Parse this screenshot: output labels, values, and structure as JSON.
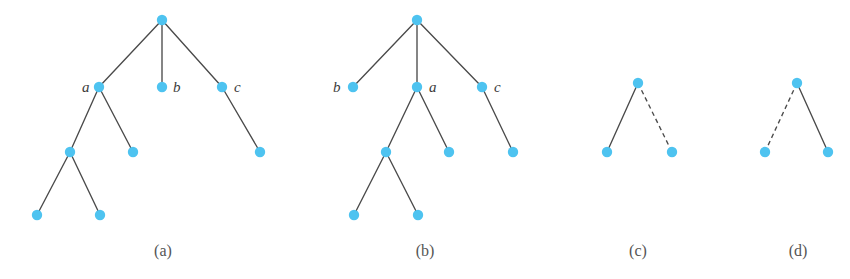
{
  "figure": {
    "background_color": "#ffffff",
    "node_color": "#4ec3f0",
    "edge_color": "#4a4a4a",
    "label_color": "#3b3b3b",
    "caption_color": "#555555",
    "node_radius": 5.2,
    "panels": [
      {
        "id": "panel-a",
        "caption": "(a)",
        "caption_x": 163,
        "caption_y": 256,
        "nodes": [
          {
            "id": "a-root",
            "x": 162,
            "y": 20,
            "label": "",
            "label_x": 0,
            "label_y": 0
          },
          {
            "id": "a-n1",
            "x": 99,
            "y": 87,
            "label": "a",
            "label_x": 82,
            "label_y": 92
          },
          {
            "id": "a-n2",
            "x": 162,
            "y": 87,
            "label": "b",
            "label_x": 173,
            "label_y": 92
          },
          {
            "id": "a-n3",
            "x": 222,
            "y": 87,
            "label": "c",
            "label_x": 234,
            "label_y": 92
          },
          {
            "id": "a-n4",
            "x": 70,
            "y": 152,
            "label": "",
            "label_x": 0,
            "label_y": 0
          },
          {
            "id": "a-n5",
            "x": 133,
            "y": 152,
            "label": "",
            "label_x": 0,
            "label_y": 0
          },
          {
            "id": "a-n6",
            "x": 260,
            "y": 152,
            "label": "",
            "label_x": 0,
            "label_y": 0
          },
          {
            "id": "a-n7",
            "x": 37,
            "y": 215,
            "label": "",
            "label_x": 0,
            "label_y": 0
          },
          {
            "id": "a-n8",
            "x": 100,
            "y": 215,
            "label": "",
            "label_x": 0,
            "label_y": 0
          }
        ],
        "edges": [
          {
            "from": "a-root",
            "to": "a-n1",
            "style": "solid"
          },
          {
            "from": "a-root",
            "to": "a-n2",
            "style": "solid"
          },
          {
            "from": "a-root",
            "to": "a-n3",
            "style": "solid"
          },
          {
            "from": "a-n1",
            "to": "a-n4",
            "style": "solid"
          },
          {
            "from": "a-n1",
            "to": "a-n5",
            "style": "solid"
          },
          {
            "from": "a-n3",
            "to": "a-n6",
            "style": "solid"
          },
          {
            "from": "a-n4",
            "to": "a-n7",
            "style": "solid"
          },
          {
            "from": "a-n4",
            "to": "a-n8",
            "style": "solid"
          }
        ]
      },
      {
        "id": "panel-b",
        "caption": "(b)",
        "caption_x": 425,
        "caption_y": 256,
        "nodes": [
          {
            "id": "b-root",
            "x": 417,
            "y": 20,
            "label": "",
            "label_x": 0,
            "label_y": 0
          },
          {
            "id": "b-n1",
            "x": 353,
            "y": 87,
            "label": "b",
            "label_x": 333,
            "label_y": 92
          },
          {
            "id": "b-n2",
            "x": 417,
            "y": 87,
            "label": "a",
            "label_x": 429,
            "label_y": 92
          },
          {
            "id": "b-n3",
            "x": 482,
            "y": 87,
            "label": "c",
            "label_x": 494,
            "label_y": 92
          },
          {
            "id": "b-n4",
            "x": 386,
            "y": 152,
            "label": "",
            "label_x": 0,
            "label_y": 0
          },
          {
            "id": "b-n5",
            "x": 449,
            "y": 152,
            "label": "",
            "label_x": 0,
            "label_y": 0
          },
          {
            "id": "b-n6",
            "x": 513,
            "y": 152,
            "label": "",
            "label_x": 0,
            "label_y": 0
          },
          {
            "id": "b-n7",
            "x": 354,
            "y": 215,
            "label": "",
            "label_x": 0,
            "label_y": 0
          },
          {
            "id": "b-n8",
            "x": 418,
            "y": 215,
            "label": "",
            "label_x": 0,
            "label_y": 0
          }
        ],
        "edges": [
          {
            "from": "b-root",
            "to": "b-n1",
            "style": "solid"
          },
          {
            "from": "b-root",
            "to": "b-n2",
            "style": "solid"
          },
          {
            "from": "b-root",
            "to": "b-n3",
            "style": "solid"
          },
          {
            "from": "b-n2",
            "to": "b-n4",
            "style": "solid"
          },
          {
            "from": "b-n2",
            "to": "b-n5",
            "style": "solid"
          },
          {
            "from": "b-n3",
            "to": "b-n6",
            "style": "solid"
          },
          {
            "from": "b-n4",
            "to": "b-n7",
            "style": "solid"
          },
          {
            "from": "b-n4",
            "to": "b-n8",
            "style": "solid"
          }
        ]
      },
      {
        "id": "panel-c",
        "caption": "(c)",
        "caption_x": 638,
        "caption_y": 256,
        "nodes": [
          {
            "id": "c-root",
            "x": 638,
            "y": 83,
            "label": "",
            "label_x": 0,
            "label_y": 0
          },
          {
            "id": "c-n1",
            "x": 607,
            "y": 152,
            "label": "",
            "label_x": 0,
            "label_y": 0
          },
          {
            "id": "c-n2",
            "x": 672,
            "y": 152,
            "label": "",
            "label_x": 0,
            "label_y": 0
          }
        ],
        "edges": [
          {
            "from": "c-root",
            "to": "c-n1",
            "style": "solid"
          },
          {
            "from": "c-root",
            "to": "c-n2",
            "style": "dashed"
          }
        ]
      },
      {
        "id": "panel-d",
        "caption": "(d)",
        "caption_x": 798,
        "caption_y": 256,
        "nodes": [
          {
            "id": "d-root",
            "x": 797,
            "y": 83,
            "label": "",
            "label_x": 0,
            "label_y": 0
          },
          {
            "id": "d-n1",
            "x": 765,
            "y": 152,
            "label": "",
            "label_x": 0,
            "label_y": 0
          },
          {
            "id": "d-n2",
            "x": 828,
            "y": 152,
            "label": "",
            "label_x": 0,
            "label_y": 0
          }
        ],
        "edges": [
          {
            "from": "d-root",
            "to": "d-n1",
            "style": "dashed"
          },
          {
            "from": "d-root",
            "to": "d-n2",
            "style": "solid"
          }
        ]
      }
    ]
  }
}
